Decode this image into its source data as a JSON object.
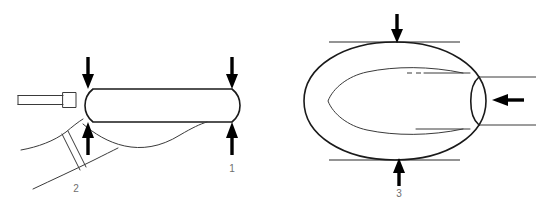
{
  "figure": {
    "background_color": "#ffffff",
    "line_color": "#1a1a1a",
    "thin_line_color": "#3a3a3a",
    "arrow_color": "#000000",
    "label_color": "#6e6e6e",
    "width": 536,
    "height": 203
  },
  "views": [
    {
      "id": "left-view",
      "name": "side-view",
      "description": "Elongated capsule body with slender tube entering from the left and an angled strap assembly below",
      "arrows": [
        {
          "id": "arrow-top-left",
          "direction": "down",
          "label": null
        },
        {
          "id": "arrow-top-right",
          "direction": "down",
          "label": "1"
        },
        {
          "id": "arrow-bottom-left",
          "direction": "up",
          "label": "2"
        },
        {
          "id": "arrow-bottom-right",
          "direction": "up",
          "label": "1"
        }
      ]
    },
    {
      "id": "right-view",
      "name": "cross-section-view",
      "description": "Oval outer profile enclosing a pointed inner leaf profile, with tube entering from the right between two tangent reference lines",
      "arrows": [
        {
          "id": "arrow-top",
          "direction": "down",
          "label": "3"
        },
        {
          "id": "arrow-bottom",
          "direction": "up",
          "label": "3"
        },
        {
          "id": "arrow-right",
          "direction": "left",
          "label": null
        }
      ]
    }
  ],
  "labels": {
    "one": "1",
    "two": "2",
    "three": "3"
  }
}
